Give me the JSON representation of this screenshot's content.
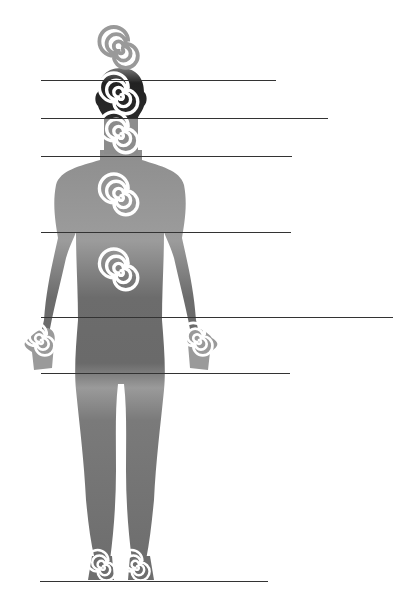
{
  "figure": {
    "type": "body-energy-diagram",
    "background": "#ffffff",
    "body_color_top": "#9a9a9a",
    "body_color_mid": "#6e6e6e",
    "head_color": "#2a2a2a",
    "spiral_color": "#ffffff",
    "line_color": "#333333"
  },
  "guide_lines": [
    {
      "y": 80,
      "x1": 41,
      "x2": 276
    },
    {
      "y": 118,
      "x1": 41,
      "x2": 328
    },
    {
      "y": 156,
      "x1": 41,
      "x2": 292
    },
    {
      "y": 232,
      "x1": 41,
      "x2": 291
    },
    {
      "y": 317,
      "x1": 41,
      "x2": 393
    },
    {
      "y": 373,
      "x1": 41,
      "x2": 290
    },
    {
      "y": 581,
      "x1": 40,
      "x2": 268
    }
  ],
  "spirals": [
    {
      "name": "crown-spiral",
      "cx": 121,
      "cy": 51,
      "r": 15,
      "on_dark": false
    },
    {
      "name": "head-spiral",
      "cx": 121,
      "cy": 97,
      "r": 15,
      "on_dark": true
    },
    {
      "name": "throat-spiral",
      "cx": 121,
      "cy": 136,
      "r": 15,
      "on_dark": true
    },
    {
      "name": "chest-spiral",
      "cx": 121,
      "cy": 198,
      "r": 15,
      "on_dark": true
    },
    {
      "name": "abdomen-spiral",
      "cx": 121,
      "cy": 273,
      "r": 15,
      "on_dark": true
    },
    {
      "name": "left-hand-spiral",
      "cx": 41,
      "cy": 340,
      "r": 12,
      "on_dark": true
    },
    {
      "name": "right-hand-spiral",
      "cx": 199,
      "cy": 340,
      "r": 12,
      "on_dark": true
    },
    {
      "name": "left-foot-spiral",
      "cx": 103,
      "cy": 567,
      "r": 12,
      "on_dark": true
    },
    {
      "name": "right-foot-spiral",
      "cx": 137,
      "cy": 567,
      "r": 12,
      "on_dark": true
    }
  ]
}
